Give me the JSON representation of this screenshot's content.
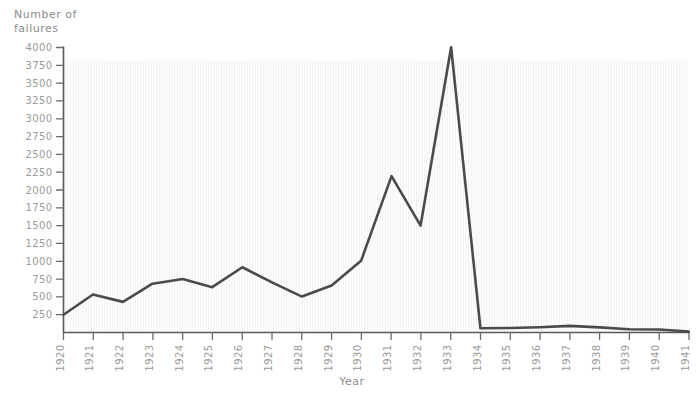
{
  "chart_data": {
    "type": "line",
    "title": "",
    "xlabel": "Year",
    "ylabel": "Number of failures",
    "ylabel_line1": "Number of",
    "ylabel_line2": "failures",
    "x": [
      1920,
      1921,
      1922,
      1923,
      1924,
      1925,
      1926,
      1927,
      1928,
      1929,
      1930,
      1931,
      1932,
      1933,
      1934,
      1935,
      1936,
      1937,
      1938,
      1939,
      1940,
      1941
    ],
    "values": [
      250,
      530,
      430,
      690,
      750,
      640,
      910,
      700,
      500,
      660,
      1000,
      2200,
      1500,
      4000,
      60,
      60,
      80,
      90,
      70,
      50,
      40,
      20
    ],
    "categories": [
      "1920",
      "1921",
      "1922",
      "1923",
      "1924",
      "1925",
      "1926",
      "1927",
      "1928",
      "1929",
      "1930",
      "1931",
      "1932",
      "1933",
      "1934",
      "1935",
      "1936",
      "1937",
      "1938",
      "1939",
      "1940",
      "1941"
    ],
    "ytick_labels": [
      "250",
      "500",
      "750",
      "1000",
      "1250",
      "1500",
      "1750",
      "2000",
      "2250",
      "2500",
      "2750",
      "3000",
      "3250",
      "3500",
      "3750",
      "4000"
    ],
    "yticks": [
      250,
      500,
      750,
      1000,
      1250,
      1500,
      1750,
      2000,
      2250,
      2500,
      2750,
      3000,
      3250,
      3500,
      3750,
      4000
    ],
    "ylim": [
      0,
      4000
    ],
    "xlim": [
      1920,
      1941
    ],
    "grid": true,
    "legend": false,
    "line_color": "#4b4b4b",
    "axis_color": "#5a5a5a",
    "label_color": "#9a9a9a",
    "background_color": "#ffffff",
    "style": "hand-drawn"
  }
}
